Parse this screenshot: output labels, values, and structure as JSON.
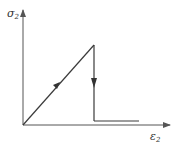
{
  "diagram": {
    "title": "",
    "y_axis": {
      "symbol": "σ",
      "subscript": "2"
    },
    "x_axis": {
      "symbol": "ε",
      "subscript": "2"
    },
    "colors": {
      "line": "#3a3a3a",
      "axis": "#555555",
      "background": "#ffffff"
    },
    "path": {
      "description": "Linear loading from origin to peak, sudden vertical drop, then horizontal plateau near zero stress",
      "points": [
        [
          0,
          0
        ],
        [
          1,
          1
        ],
        [
          1,
          0.05
        ],
        [
          1.6,
          0.05
        ]
      ]
    }
  }
}
